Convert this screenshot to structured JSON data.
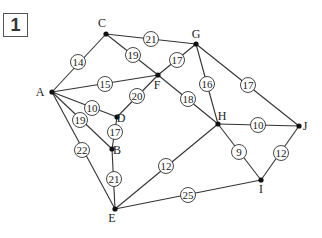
{
  "problem_number": "1",
  "colors": {
    "line": "#333333",
    "node": "#111111",
    "circle_fill": "#ffffff",
    "text": "#222222"
  },
  "nodes": [
    {
      "id": "A",
      "x": 52,
      "y": 92,
      "lx": 40,
      "ly": 96
    },
    {
      "id": "C",
      "x": 106,
      "y": 34,
      "lx": 102,
      "ly": 27
    },
    {
      "id": "G",
      "x": 196,
      "y": 44,
      "lx": 196,
      "ly": 38
    },
    {
      "id": "F",
      "x": 158,
      "y": 75,
      "lx": 157,
      "ly": 89
    },
    {
      "id": "D",
      "x": 117,
      "y": 117,
      "lx": 121,
      "ly": 122
    },
    {
      "id": "B",
      "x": 112,
      "y": 149,
      "lx": 117,
      "ly": 154
    },
    {
      "id": "H",
      "x": 218,
      "y": 124,
      "lx": 222,
      "ly": 120
    },
    {
      "id": "J",
      "x": 299,
      "y": 126,
      "lx": 305,
      "ly": 130
    },
    {
      "id": "I",
      "x": 261,
      "y": 180,
      "lx": 261,
      "ly": 193
    },
    {
      "id": "E",
      "x": 115,
      "y": 209,
      "lx": 112,
      "ly": 222
    }
  ],
  "edges": [
    {
      "from": "A",
      "to": "C",
      "weight": "14",
      "cx": 78,
      "cy": 62
    },
    {
      "from": "C",
      "to": "G",
      "weight": "21",
      "cx": 151,
      "cy": 39
    },
    {
      "from": "C",
      "to": "F",
      "weight": "19",
      "cx": 133,
      "cy": 55
    },
    {
      "from": "A",
      "to": "F",
      "weight": "15",
      "cx": 105,
      "cy": 84
    },
    {
      "from": "F",
      "to": "G",
      "weight": "17",
      "cx": 177,
      "cy": 60
    },
    {
      "from": "G",
      "to": "H",
      "weight": "16",
      "cx": 207,
      "cy": 84
    },
    {
      "from": "G",
      "to": "J",
      "weight": "17",
      "cx": 248,
      "cy": 85
    },
    {
      "from": "F",
      "to": "H",
      "weight": "18",
      "cx": 188,
      "cy": 99
    },
    {
      "from": "A",
      "to": "D",
      "weight": "10",
      "cx": 92,
      "cy": 108
    },
    {
      "from": "D",
      "to": "F",
      "weight": "20",
      "cx": 137,
      "cy": 96
    },
    {
      "from": "A",
      "to": "B",
      "weight": "19",
      "cx": 80,
      "cy": 120
    },
    {
      "from": "D",
      "to": "B",
      "weight": "17",
      "cx": 115,
      "cy": 132
    },
    {
      "from": "A",
      "to": "E",
      "weight": "22",
      "cx": 82,
      "cy": 150
    },
    {
      "from": "B",
      "to": "E",
      "weight": "21",
      "cx": 114,
      "cy": 179
    },
    {
      "from": "E",
      "to": "H",
      "weight": "12",
      "cx": 166,
      "cy": 166
    },
    {
      "from": "E",
      "to": "I",
      "weight": "25",
      "cx": 188,
      "cy": 195
    },
    {
      "from": "H",
      "to": "J",
      "weight": "10",
      "cx": 258,
      "cy": 125
    },
    {
      "from": "H",
      "to": "I",
      "weight": "9",
      "cx": 239,
      "cy": 152
    },
    {
      "from": "I",
      "to": "J",
      "weight": "12",
      "cx": 281,
      "cy": 153
    }
  ]
}
